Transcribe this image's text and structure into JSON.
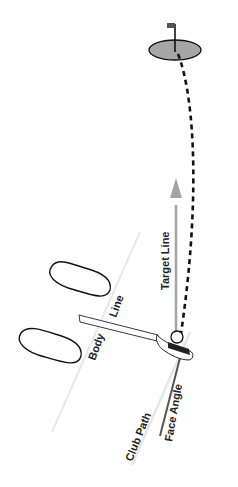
{
  "diagram": {
    "type": "golf-ball-flight-diagram",
    "labels": {
      "target_line": "Target Line",
      "body": "Body",
      "line": "Line",
      "face_angle": "Face Angle",
      "club_path": "Club Path"
    },
    "colors": {
      "green": "#a6a6a6",
      "flag": "#555555",
      "target_arrow": "#a3a3a3",
      "ball_flight": "#111111",
      "face_line": "#555555",
      "guide_lines": "#e6e6e6",
      "outline": "#111111"
    },
    "elements": [
      "green-with-flag",
      "curved-ball-flight-path",
      "target-line-arrow",
      "feet-outlines",
      "body-line",
      "club-shaft",
      "club-head",
      "ball",
      "face-angle-line",
      "club-path-line"
    ]
  }
}
